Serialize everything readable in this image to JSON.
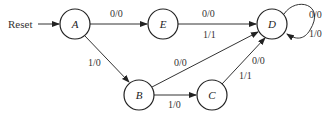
{
  "diagram": {
    "type": "state-diagram",
    "reset_label": "Reset",
    "states": [
      {
        "id": "A",
        "label": "A",
        "cx": 75,
        "cy": 24
      },
      {
        "id": "E",
        "label": "E",
        "cx": 163,
        "cy": 24
      },
      {
        "id": "D",
        "label": "D",
        "cx": 272,
        "cy": 24
      },
      {
        "id": "B",
        "label": "B",
        "cx": 139,
        "cy": 95
      },
      {
        "id": "C",
        "label": "C",
        "cx": 212,
        "cy": 95
      }
    ],
    "transitions": [
      {
        "from": "A",
        "to": "E",
        "label": "0/0"
      },
      {
        "from": "A",
        "to": "B",
        "label": "1/0"
      },
      {
        "from": "E",
        "to": "D",
        "label_top": "0/0",
        "label_bottom": "1/1"
      },
      {
        "from": "B",
        "to": "D",
        "label": "0/0"
      },
      {
        "from": "B",
        "to": "C",
        "label": "1/0"
      },
      {
        "from": "C",
        "to": "D",
        "label_top": "0/0",
        "label_bottom": "1/1"
      },
      {
        "from": "D",
        "to": "D",
        "label_top": "0/0",
        "label_bottom": "1/0"
      }
    ]
  }
}
